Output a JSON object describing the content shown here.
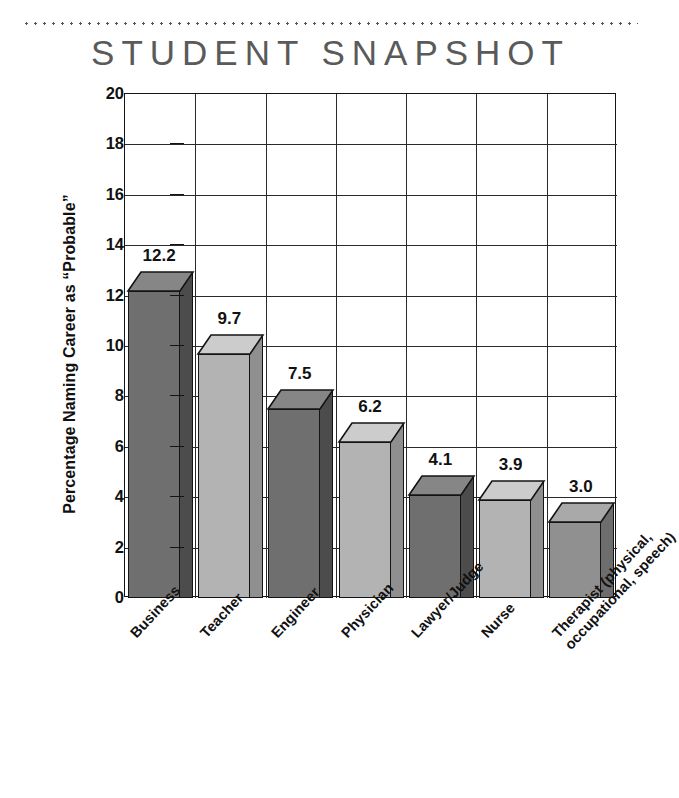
{
  "page": {
    "title": "STUDENT SNAPSHOT",
    "divider": "dotted-rule"
  },
  "chart_data": {
    "type": "bar",
    "title": "STUDENT SNAPSHOT",
    "xlabel": "",
    "ylabel": "Percentage Naming Career as “Probable”",
    "ylim": [
      0,
      20
    ],
    "ytick_step": 2,
    "yticks": [
      "0",
      "2",
      "4",
      "6",
      "8",
      "10",
      "12",
      "14",
      "16",
      "18",
      "20"
    ],
    "grid": "both",
    "legend": "none",
    "three_d": true,
    "categories": [
      "Business",
      "Teacher",
      "Engineer",
      "Physician",
      "Lawyer/Judge",
      "Nurse",
      "Therapist (physical,\noccupational, speech)"
    ],
    "category_lines": [
      [
        "Business"
      ],
      [
        "Teacher"
      ],
      [
        "Engineer"
      ],
      [
        "Physician"
      ],
      [
        "Lawyer/Judge"
      ],
      [
        "Nurse"
      ],
      [
        "Therapist (physical,",
        "occupational, speech)"
      ]
    ],
    "values": [
      12.2,
      9.7,
      7.5,
      6.2,
      4.1,
      3.9,
      3.0
    ],
    "value_labels": [
      "12.2",
      "9.7",
      "7.5",
      "6.2",
      "4.1",
      "3.9",
      "3.0"
    ],
    "bar_tones": [
      "dark",
      "light",
      "dark",
      "light",
      "dark",
      "light",
      "medium"
    ]
  },
  "colors": {
    "bar_dark_front": "#6f6f6f",
    "bar_dark_side": "#4c4c4c",
    "bar_dark_top": "#868686",
    "bar_light_front": "#b3b3b3",
    "bar_light_side": "#8f8f8f",
    "bar_light_top": "#cccccc",
    "bar_medium_front": "#909090",
    "bar_medium_side": "#6d6d6d",
    "bar_medium_top": "#a9a9a9",
    "outline": "#141414",
    "grid": "#2a2a2a",
    "title_gray": "#5a5a5a",
    "text": "#111111",
    "background": "#ffffff"
  }
}
